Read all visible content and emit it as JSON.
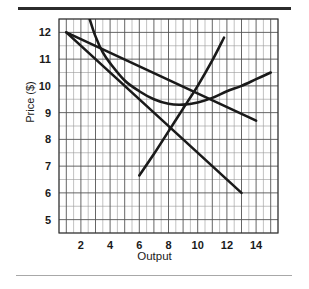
{
  "figure": {
    "background_color": "#ffffff",
    "top_rule_color": "#2b2b2b",
    "bottom_rule_color": "#a8a8a8"
  },
  "chart_data": {
    "type": "line",
    "title": "",
    "xlabel": "Output",
    "ylabel": "Price ($)",
    "xlim": [
      0.5,
      15.5
    ],
    "ylim": [
      4.5,
      12.5
    ],
    "xticks": [
      2,
      4,
      6,
      8,
      10,
      12,
      14
    ],
    "xtick_labels": [
      "2",
      "4",
      "6",
      "8",
      "10",
      "12",
      "14"
    ],
    "yticks": [
      5,
      6,
      7,
      8,
      9,
      10,
      11,
      12
    ],
    "ytick_labels": [
      "5",
      "6",
      "7",
      "8",
      "9",
      "10",
      "11",
      "12"
    ],
    "grid": true,
    "grid_major_step_x": 1,
    "grid_minor_step_x": 0.5,
    "grid_major_step_y": 1,
    "grid_minor_step_y": 0.5,
    "grid_color": "#555555",
    "grid_minor_color": "#999999",
    "legend": "none",
    "curve_color": "#1a1a1a",
    "series": [
      {
        "name": "marginal-revenue-line",
        "kind": "line",
        "x": [
          1.0,
          2.0,
          4.0,
          6.0,
          8.0,
          10.0,
          11.5,
          13.0
        ],
        "y": [
          12.0,
          11.3,
          9.9,
          8.5,
          7.1,
          5.7,
          4.65,
          6.0
        ],
        "points": [
          [
            1.0,
            12.0
          ],
          [
            13.0,
            6.0
          ]
        ]
      },
      {
        "name": "demand-line",
        "kind": "line",
        "x": [
          1.0,
          14.0
        ],
        "y": [
          12.0,
          8.7
        ],
        "points": [
          [
            1.0,
            12.0
          ],
          [
            14.0,
            8.7
          ]
        ]
      },
      {
        "name": "average-total-cost-curve",
        "kind": "curve",
        "x": [
          2.6,
          3.0,
          3.5,
          4.0,
          5.0,
          6.0,
          7.0,
          8.0,
          9.0,
          10.0,
          11.0,
          12.0,
          13.0,
          14.0,
          15.0
        ],
        "y": [
          12.5,
          11.85,
          11.25,
          10.85,
          10.2,
          9.8,
          9.5,
          9.33,
          9.3,
          9.38,
          9.55,
          9.8,
          10.0,
          10.25,
          10.5
        ]
      },
      {
        "name": "marginal-cost-curve",
        "kind": "curve",
        "x": [
          6.0,
          7.0,
          8.0,
          9.0,
          10.0,
          11.0,
          11.8
        ],
        "y": [
          6.65,
          7.45,
          8.3,
          9.15,
          10.0,
          10.95,
          11.8
        ]
      }
    ]
  }
}
